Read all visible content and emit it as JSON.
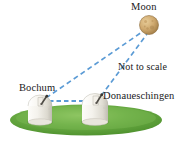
{
  "figure": {
    "background_color": "#ffffff",
    "width": 188,
    "height": 142
  },
  "labels": {
    "moon": "Moon",
    "not_to_scale": "Not to scale",
    "bochum": "Bochum",
    "donaueschingen": "Donaueschingen"
  },
  "colors": {
    "sight_line": "#5b9bd5",
    "baseline": "#5b9bd5",
    "grass_light": "#86c25a",
    "grass_mid": "#63a83a",
    "grass_dark": "#4a8f2d",
    "moon_light": "#e3c48d",
    "moon_mid": "#c9a368",
    "moon_dark": "#9d7b44",
    "dome_light": "#ffffff",
    "dome_mid": "#ebe8e0",
    "dome_shadow": "#c9c6bd",
    "text": "#1a1a1a",
    "telescope": "#4d4a44"
  },
  "scene": {
    "moon": {
      "cx": 149,
      "cy": 25,
      "r": 9.5,
      "name": "moon-body"
    },
    "observatories": [
      {
        "id": "bochum",
        "cx": 40,
        "base_y": 122,
        "top_y": 96,
        "width": 24
      },
      {
        "id": "donaueschingen",
        "cx": 95,
        "base_y": 122,
        "top_y": 95,
        "width": 26
      }
    ],
    "grass": {
      "cx": 86,
      "cy": 120,
      "rx": 76,
      "ry": 16
    },
    "sight_lines": [
      {
        "name": "bochum-to-moon",
        "x1": 46,
        "y1": 97,
        "x2": 143,
        "y2": 31
      },
      {
        "name": "donaueschingen-to-moon",
        "x1": 101,
        "y1": 96,
        "x2": 147,
        "y2": 34
      }
    ],
    "baseline": {
      "name": "bochum-donaueschingen-baseline",
      "x1": 50,
      "y1": 101,
      "x2": 98,
      "y2": 101
    }
  }
}
